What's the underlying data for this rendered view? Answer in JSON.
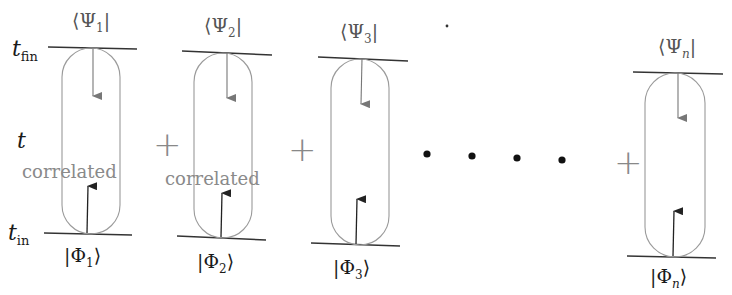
{
  "figure": {
    "time_axis": {
      "t_fin": {
        "symbol": "t",
        "sub": "fin"
      },
      "t": {
        "symbol": "t"
      },
      "t_in": {
        "symbol": "t",
        "sub": "in"
      }
    },
    "terms": [
      {
        "bra": {
          "open": "⟨Ψ",
          "sub": "1",
          "close": "|"
        },
        "ket": {
          "open": "|Φ",
          "sub": "1",
          "close": "⟩"
        },
        "label": "correlated"
      },
      {
        "bra": {
          "open": "⟨Ψ",
          "sub": "2",
          "close": "|"
        },
        "ket": {
          "open": "|Φ",
          "sub": "2",
          "close": "⟩"
        },
        "label": "correlated"
      },
      {
        "bra": {
          "open": "⟨Ψ",
          "sub": "3",
          "close": "|"
        },
        "ket": {
          "open": "|Φ",
          "sub": "3",
          "close": "⟩"
        },
        "label": ""
      },
      {
        "bra": {
          "open": "⟨Ψ",
          "sub": "n",
          "close": "|"
        },
        "ket": {
          "open": "|Φ",
          "sub": "n",
          "close": "⟩"
        },
        "label": ""
      }
    ],
    "operators": [
      "+",
      "+",
      "+"
    ],
    "ellipsis": "• • • •",
    "colors": {
      "line": "#333333",
      "loop": "#9a9a9a",
      "arrow_down": "#777777",
      "arrow_up": "#222222",
      "label": "#8a8a8a"
    }
  }
}
